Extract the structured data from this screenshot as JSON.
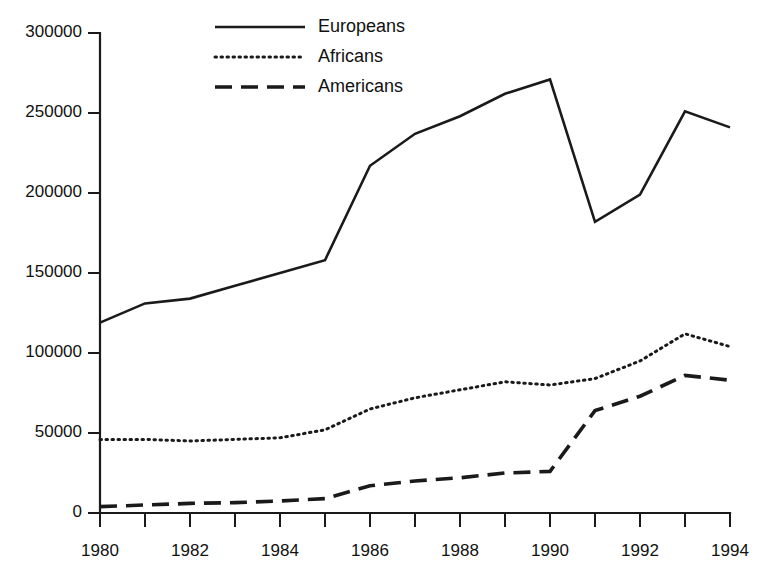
{
  "chart_data": {
    "type": "line",
    "title": "",
    "subtitle": "",
    "xlabel": "",
    "ylabel": "",
    "x": [
      1980,
      1981,
      1982,
      1983,
      1984,
      1985,
      1986,
      1987,
      1988,
      1989,
      1990,
      1991,
      1992,
      1993,
      1994
    ],
    "xlim": [
      1980,
      1994
    ],
    "ylim": [
      0,
      300000
    ],
    "grid": false,
    "legend_position": "top-center",
    "x_tick_values": [
      1980,
      1981,
      1982,
      1983,
      1984,
      1985,
      1986,
      1987,
      1988,
      1989,
      1990,
      1991,
      1992,
      1993,
      1994
    ],
    "x_tick_labels": [
      "1980",
      "",
      "1982",
      "",
      "1984",
      "",
      "1986",
      "",
      "1988",
      "",
      "1990",
      "",
      "1992",
      "",
      "1994"
    ],
    "y_tick_values": [
      0,
      50000,
      100000,
      150000,
      200000,
      250000,
      300000
    ],
    "y_tick_labels": [
      "0",
      "50000",
      "100000",
      "150000",
      "200000",
      "250000",
      "300000"
    ],
    "series": [
      {
        "name": "Europeans",
        "style": "solid",
        "color": "#1a1a1a",
        "values": [
          119000,
          131000,
          134000,
          142000,
          150000,
          158000,
          217000,
          237000,
          248000,
          262000,
          271000,
          182000,
          199000,
          251000,
          241000
        ]
      },
      {
        "name": "Africans",
        "style": "dotted",
        "color": "#1a1a1a",
        "values": [
          46000,
          46000,
          45000,
          46000,
          47000,
          52000,
          65000,
          72000,
          77000,
          82000,
          80000,
          84000,
          95000,
          112000,
          104000
        ]
      },
      {
        "name": "Americans",
        "style": "dashed",
        "color": "#1a1a1a",
        "values": [
          4000,
          5000,
          6000,
          6500,
          7500,
          9000,
          17000,
          20000,
          22000,
          25000,
          26000,
          64000,
          73000,
          86000,
          83000
        ]
      }
    ]
  },
  "legend": {
    "entries": [
      {
        "label": "Europeans",
        "style": "solid"
      },
      {
        "label": "Africans",
        "style": "dotted"
      },
      {
        "label": "Americans",
        "style": "dashed"
      }
    ]
  }
}
